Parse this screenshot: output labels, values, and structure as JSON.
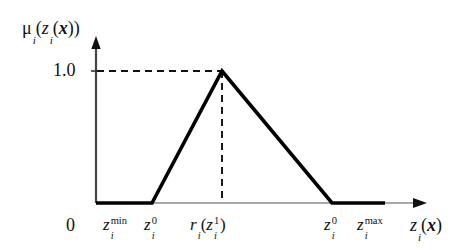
{
  "figure": {
    "background_color": "#ffffff",
    "stroke_color": "#111111",
    "axis_color": "#555555",
    "curve_color": "#000000"
  },
  "axes": {
    "y_axis_label_plain": "μ_i(z_i(x))",
    "y_axis_label_parts": {
      "mu": "μ",
      "mu_sub": "i",
      "open1": "(",
      "z": "z",
      "z_sub": "i",
      "open2": "(",
      "x": "x",
      "close2": ")",
      "close1": ")"
    },
    "y_tick_label": "1.0",
    "y_tick_value": 1.0,
    "x_origin_label": "0",
    "x_axis_label_plain": "z_i(x)",
    "x_axis_label_parts": {
      "z": "z",
      "z_sub": "i",
      "open": "(",
      "x": "x",
      "close": ")"
    }
  },
  "x_ticks": [
    {
      "name": "z-min",
      "plain": "z_i^min",
      "base": "z",
      "sub": "i",
      "sup": "min",
      "pixel_x": 122
    },
    {
      "name": "z-zero-left",
      "plain": "z_i^0",
      "base": "z",
      "sub": "i",
      "sup": "0",
      "pixel_x": 152
    },
    {
      "name": "r-z-one",
      "plain": "r_i(z_i^1)",
      "base": "r",
      "sub": "i",
      "open": "(",
      "inner_base": "z",
      "inner_sub": "i",
      "inner_sup": "1",
      "close": ")",
      "pixel_x": 222
    },
    {
      "name": "z-zero-right",
      "plain": "z_i^0",
      "base": "z",
      "sub": "i",
      "sup": "0",
      "pixel_x": 332
    },
    {
      "name": "z-max",
      "plain": "z_i^max",
      "base": "z",
      "sub": "i",
      "sup": "max",
      "pixel_x": 378
    }
  ],
  "chart_data": {
    "type": "line",
    "title": "",
    "xlabel": "z_i(x)",
    "ylabel": "μ_i(z_i(x))",
    "xlim": [
      0,
      1
    ],
    "ylim": [
      0,
      1
    ],
    "grid": false,
    "legend": null,
    "series": [
      {
        "name": "membership-function",
        "description": "Triangular fuzzy membership function: zero up to z_i^0 (left), rising linearly to 1.0 at r_i(z_i^1), falling linearly to zero at z_i^0 (right), zero thereafter to z_i^max.",
        "points": [
          {
            "x_label": "0",
            "mu": 0.0,
            "pixel_x": 96,
            "pixel_y": 203
          },
          {
            "x_label": "z_i^min",
            "mu": 0.0,
            "pixel_x": 122,
            "pixel_y": 203
          },
          {
            "x_label": "z_i^0",
            "mu": 0.0,
            "pixel_x": 152,
            "pixel_y": 203
          },
          {
            "x_label": "r_i(z_i^1)",
            "mu": 1.0,
            "pixel_x": 222,
            "pixel_y": 71
          },
          {
            "x_label": "z_i^0",
            "mu": 0.0,
            "pixel_x": 332,
            "pixel_y": 203
          },
          {
            "x_label": "z_i^max",
            "mu": 0.0,
            "pixel_x": 385,
            "pixel_y": 203
          }
        ]
      }
    ],
    "annotations": [
      {
        "name": "peak-horizontal-guide",
        "style": "dashed",
        "from": [
          97,
          71
        ],
        "to": [
          222,
          71
        ],
        "label": "1.0"
      },
      {
        "name": "peak-vertical-guide",
        "style": "dashed",
        "from": [
          222,
          71
        ],
        "to": [
          222,
          203
        ],
        "label": "r_i(z_i^1)"
      }
    ]
  }
}
